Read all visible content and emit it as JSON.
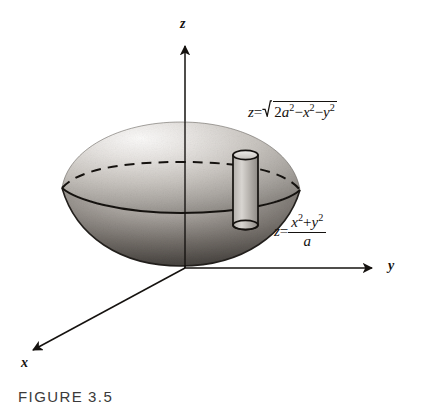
{
  "figure": {
    "caption_label": "FIGURE",
    "caption_number": "3.5",
    "background_color": "#ffffff",
    "ink_color": "#15120f"
  },
  "axes": {
    "z_label": "z",
    "y_label": "y",
    "x_label": "x",
    "origin": {
      "x": 185,
      "y": 268
    }
  },
  "equations": {
    "sphere": {
      "lhs": "z",
      "equals": "=",
      "radicand_parts": {
        "coefficient": "2",
        "a_var": "a",
        "a_exp": "2",
        "minus_1": "−",
        "x_var": "x",
        "x_exp": "2",
        "minus_2": "−",
        "y_var": "y",
        "y_exp": "2"
      },
      "plain_text": "z = √(2a² − x² − y²)"
    },
    "paraboloid": {
      "lhs": "z",
      "equals": "=",
      "numerator_parts": {
        "x_var": "x",
        "x_exp": "2",
        "plus": "+",
        "y_var": "y",
        "y_exp": "2"
      },
      "denominator": "a",
      "plain_text": "z = (x² + y²)/a"
    }
  },
  "solid": {
    "name": "lens-shaped solid of revolution",
    "upper_surface": "sphere cap",
    "lower_surface": "paraboloid",
    "left_tip": {
      "x": 62,
      "y": 188
    },
    "right_tip": {
      "x": 300,
      "y": 190
    },
    "top": {
      "x": 181,
      "y": 122
    },
    "bottom": {
      "x": 181,
      "y": 265
    },
    "shading": {
      "highlight_color": "#f2f0ee",
      "midtone_color": "#b9b5b0",
      "shadow_color": "#4a4743"
    }
  },
  "intersection_curve": {
    "back_arc_style": "dashed",
    "front_arc_style": "solid",
    "back_arc_peak_y": 163,
    "front_arc_dip_y": 205
  },
  "volume_element": {
    "name": "cylindrical shell",
    "left": 232,
    "right": 258,
    "top_y": 152,
    "bottom_y": 228
  }
}
